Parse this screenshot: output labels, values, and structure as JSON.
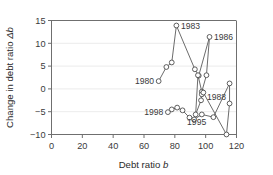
{
  "figure": {
    "background": "#ffffff",
    "line_color": "#5b5b5b",
    "marker_face": "#ffffff",
    "marker_edge": "#4d4d4d",
    "grid_color": "#e6e6e6",
    "axis_color": "#6f6f6f"
  },
  "chart_data": {
    "type": "line",
    "title": "",
    "subtitle": "",
    "xlabel": "Debt ratio b",
    "ylabel": "Change in debt ratio Δb",
    "xlim": [
      0,
      120
    ],
    "ylim": [
      -10,
      15
    ],
    "xticks": [
      0,
      20,
      40,
      60,
      80,
      100,
      120
    ],
    "yticks": [
      -10,
      -5,
      0,
      5,
      10,
      15
    ],
    "xticklabels": [
      "0",
      "20",
      "40",
      "60",
      "80",
      "100",
      "120"
    ],
    "yticklabels": [
      "−10",
      "−5",
      "0",
      "5",
      "10",
      "15"
    ],
    "grid": true,
    "grid_axis": "y",
    "legend": false,
    "legend_position": "none",
    "marker": "circle-open",
    "series": [
      {
        "name": "Debt ratio trajectory",
        "x": [
          69.5,
          74.5,
          78.0,
          81.0,
          93.0,
          95.5,
          102.5,
          100.5,
          97.5,
          95.0,
          93.5,
          97.0,
          97.5,
          98.5,
          113.5,
          115.5,
          115.5,
          105.0,
          97.5,
          92.5,
          89.5,
          85.0,
          81.5,
          78.0,
          75.5
        ],
        "y": [
          1.7,
          4.8,
          5.8,
          13.9,
          4.3,
          2.9,
          11.4,
          3.0,
          -0.6,
          3.0,
          -5.6,
          -2.5,
          -1.2,
          -0.8,
          -10.0,
          -3.2,
          1.2,
          -6.2,
          -5.6,
          -6.7,
          -6.3,
          -4.7,
          -4.1,
          -4.5,
          -5.1
        ]
      }
    ],
    "annotations": [
      {
        "text": "1980",
        "x": 69.5,
        "y": 1.7,
        "placement": "left"
      },
      {
        "text": "1983",
        "x": 81.0,
        "y": 13.9,
        "placement": "right"
      },
      {
        "text": "1986",
        "x": 102.5,
        "y": 11.4,
        "placement": "right"
      },
      {
        "text": "1988",
        "x": 115.5,
        "y": -3.2,
        "placement": "left-above"
      },
      {
        "text": "1995",
        "x": 93.5,
        "y": -5.6,
        "placement": "below"
      },
      {
        "text": "1998",
        "x": 75.5,
        "y": -5.1,
        "placement": "left"
      }
    ]
  },
  "axes": {
    "x_title": "Debt ratio b",
    "x_title_plain": "Debt ratio",
    "x_title_symbol": "b",
    "y_title_plain": "Change in debt ratio",
    "y_title_symbol": "Δb"
  }
}
